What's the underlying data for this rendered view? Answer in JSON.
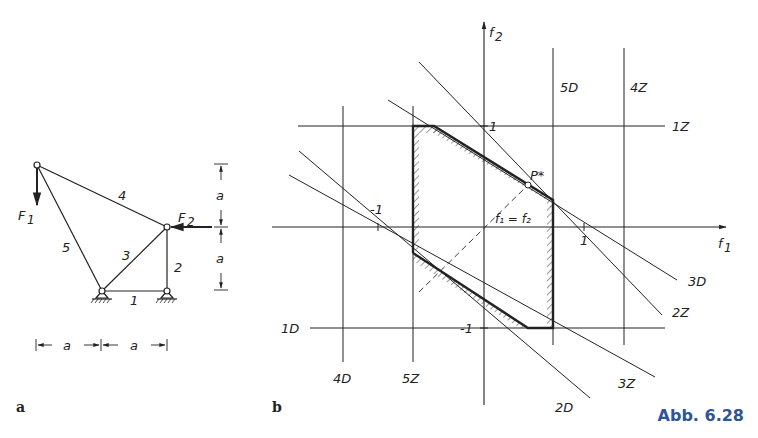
{
  "caption": "Abb. 6.28",
  "panel_a": {
    "label": "a",
    "members": [
      "1",
      "2",
      "3",
      "4",
      "5"
    ],
    "forces": {
      "f1": "F",
      "f1_sub": "1",
      "f2": "F",
      "f2_sub": "2"
    },
    "dimension_label": "a"
  },
  "panel_b": {
    "label": "b",
    "axes": {
      "x": "f",
      "x_sub": "1",
      "y": "f",
      "y_sub": "2"
    },
    "ticks": {
      "one": "1",
      "minus_one": "-1"
    },
    "lines": {
      "d1": "1D",
      "z1": "1Z",
      "d2": "2D",
      "z2": "2Z",
      "d3": "3D",
      "z3": "3Z",
      "d4": "4D",
      "z4": "4Z",
      "d5": "5D",
      "z5": "5Z"
    },
    "optimum_point": "P*",
    "diagonal_label": "f₁ = f₂"
  },
  "colors": {
    "ink": "#222222",
    "caption": "#2f5597"
  }
}
